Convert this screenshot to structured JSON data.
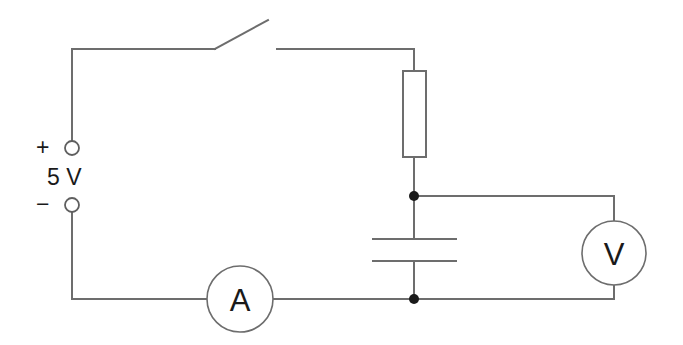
{
  "diagram": {
    "background_color": "#ffffff",
    "line_color": "#6d6d6d",
    "text_color": "#1a1a1a",
    "junction_color": "#1a1a1a"
  },
  "source": {
    "name": "dc-power-supply",
    "plus_label": "+",
    "minus_label": "−",
    "voltage_label": "5 V"
  },
  "components": {
    "switch": {
      "name": "open-switch",
      "state": "open"
    },
    "resistor": {
      "name": "resistor",
      "label": "",
      "shape": "rectangle"
    },
    "capacitor": {
      "name": "capacitor",
      "label": "",
      "shape": "parallel-plates"
    },
    "ammeter": {
      "name": "ammeter",
      "label": "A"
    },
    "voltmeter": {
      "name": "voltmeter",
      "label": "V"
    }
  },
  "junctions": [
    {
      "name": "upper-node",
      "x": 414,
      "y": 196
    },
    {
      "name": "lower-node",
      "x": 414,
      "y": 299
    }
  ]
}
